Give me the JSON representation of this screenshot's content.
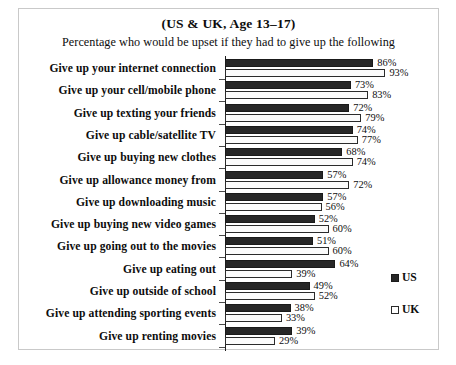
{
  "chart_data": {
    "type": "bar",
    "title": "(US & UK, Age 13–17)",
    "subtitle": "Percentage who would be upset if they had to give up the following",
    "orientation": "horizontal",
    "grouping": "grouped",
    "xlabel": "",
    "ylabel": "",
    "xlim": [
      0,
      100
    ],
    "grid": false,
    "legend_position": "right",
    "value_suffix": "%",
    "categories": [
      "Give up your internet connection",
      "Give up your cell/mobile phone",
      "Give up texting your friends",
      "Give up cable/satellite TV",
      "Give up buying new clothes",
      "Give up allowance money from",
      "Give up downloading music",
      "Give up buying new video games",
      "Give up going out to the movies",
      "Give up eating out",
      "Give up outside of  school",
      "Give up attending sporting events",
      "Give up renting movies"
    ],
    "series": [
      {
        "name": "US",
        "color": "#272727",
        "values": [
          86,
          73,
          72,
          74,
          68,
          57,
          57,
          52,
          51,
          64,
          49,
          38,
          39
        ],
        "labels": [
          "86%",
          "73%",
          "72%",
          "74%",
          "68%",
          "57%",
          "57%",
          "52%",
          "51%",
          "64%",
          "49%",
          "38%",
          "39%"
        ]
      },
      {
        "name": "UK",
        "color": "#ffffff",
        "values": [
          93,
          83,
          79,
          77,
          74,
          72,
          56,
          60,
          60,
          39,
          52,
          33,
          29
        ],
        "labels": [
          "93%",
          "83%",
          "79%",
          "77%",
          "74%",
          "72%",
          "56%",
          "60%",
          "60%",
          "39%",
          "52%",
          "33%",
          "29%"
        ]
      }
    ]
  },
  "legend": {
    "items": [
      {
        "label": "US",
        "swatch": "filled-square"
      },
      {
        "label": "UK",
        "swatch": "hollow-square"
      }
    ]
  }
}
